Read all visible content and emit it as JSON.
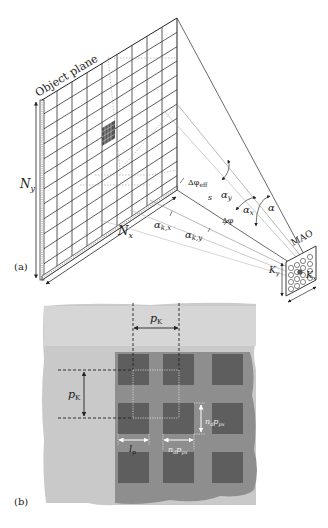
{
  "panel_a": {
    "label": "(a)",
    "object_plane_label": "Object plane",
    "ny_label": "N",
    "ny_sub": "y",
    "nx_label": "N",
    "nx_sub": "x",
    "delta_phi_eff": "Δφ",
    "delta_phi_eff_sub": "eff",
    "s_label": "s",
    "delta_phi": "Δφ",
    "alpha_y": "α",
    "alpha_y_sub": "y",
    "alpha_x": "α",
    "alpha_x_sub": "x",
    "alpha": "α",
    "alpha_kx": "α",
    "alpha_kx_sub": "k,x",
    "alpha_ky": "α",
    "alpha_ky_sub": "k,y",
    "mao_label": "MAO",
    "ky_label": "K",
    "ky_sub": "y",
    "kx_label": "K",
    "kx_sub": "x"
  },
  "panel_b": {
    "label": "(b)",
    "pk_horizontal": "p",
    "pk_horizontal_sub": "K",
    "pk_vertical": "p",
    "pk_vertical_sub": "K",
    "lp_label": "l",
    "lp_sub": "p",
    "nd_ppx_vertical": "n",
    "nd_ppx_vertical_sub1": "d",
    "nd_ppx_vertical_p": "p",
    "nd_ppx_vertical_sub2": "px",
    "nd_ppx_horizontal": "n",
    "nd_ppx_horizontal_sub1": "d",
    "nd_ppx_horizontal_p": "p",
    "nd_ppx_horizontal_sub2": "px"
  },
  "colors": {
    "outer_region": "#c9c9c9",
    "inner_region": "#8e8e8e",
    "pixel_squares": "#5e5e5e",
    "lines": "#333333"
  }
}
